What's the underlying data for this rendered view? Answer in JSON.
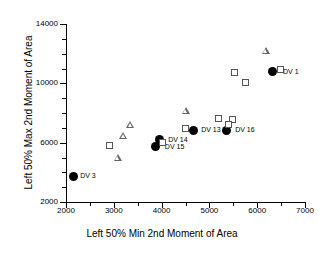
{
  "chart_data": {
    "type": "scatter",
    "title": "",
    "xlabel": "Left 50% Min 2nd Moment of Area",
    "ylabel": "Left 50% Max 2nd Moment of Area",
    "xlim": [
      2000,
      7000
    ],
    "ylim": [
      2000,
      14000
    ],
    "xticks": [
      2000,
      3000,
      4000,
      5000,
      6000,
      7000
    ],
    "yticks": [
      2000,
      6000,
      10000,
      14000
    ],
    "xtick_labels": [
      "2000",
      "3000",
      "4000",
      "5000",
      "6000",
      "7000"
    ],
    "ytick_labels": [
      "2000",
      "6000",
      "10000",
      "14000"
    ],
    "xminor_step": 500,
    "yminor_step": 1000,
    "grid": false,
    "legend": "none",
    "series": [
      {
        "name": "filled-circle",
        "marker": "circle",
        "points": [
          {
            "x": 2150,
            "y": 3750,
            "label": "DV 3",
            "label_dx": 7,
            "label_dy": 0
          },
          {
            "x": 3950,
            "y": 6200,
            "label": "DV 14",
            "label_dx": 9,
            "label_dy": 0
          },
          {
            "x": 3880,
            "y": 5750,
            "label": "DV 15",
            "label_dx": 9,
            "label_dy": 1
          },
          {
            "x": 4660,
            "y": 6850,
            "label": "DV 13",
            "label_dx": 8,
            "label_dy": 0
          },
          {
            "x": 5350,
            "y": 6850,
            "label": "DV 16",
            "label_dx": 9,
            "label_dy": 0
          },
          {
            "x": 6310,
            "y": 10800,
            "label": "DV 1",
            "label_dx": 11,
            "label_dy": 1
          }
        ]
      },
      {
        "name": "open-square",
        "marker": "square",
        "points": [
          {
            "x": 2900,
            "y": 5800
          },
          {
            "x": 4020,
            "y": 6000
          },
          {
            "x": 4510,
            "y": 6950
          },
          {
            "x": 5190,
            "y": 7650
          },
          {
            "x": 5480,
            "y": 7550
          },
          {
            "x": 5400,
            "y": 7200
          },
          {
            "x": 5520,
            "y": 10750
          },
          {
            "x": 5760,
            "y": 10050
          },
          {
            "x": 6480,
            "y": 10900
          }
        ]
      },
      {
        "name": "open-triangle",
        "marker": "triangle",
        "points": [
          {
            "x": 3080,
            "y": 4950
          },
          {
            "x": 3200,
            "y": 6450
          },
          {
            "x": 3340,
            "y": 7200
          },
          {
            "x": 4500,
            "y": 8150
          },
          {
            "x": 6180,
            "y": 12150
          }
        ]
      }
    ]
  }
}
